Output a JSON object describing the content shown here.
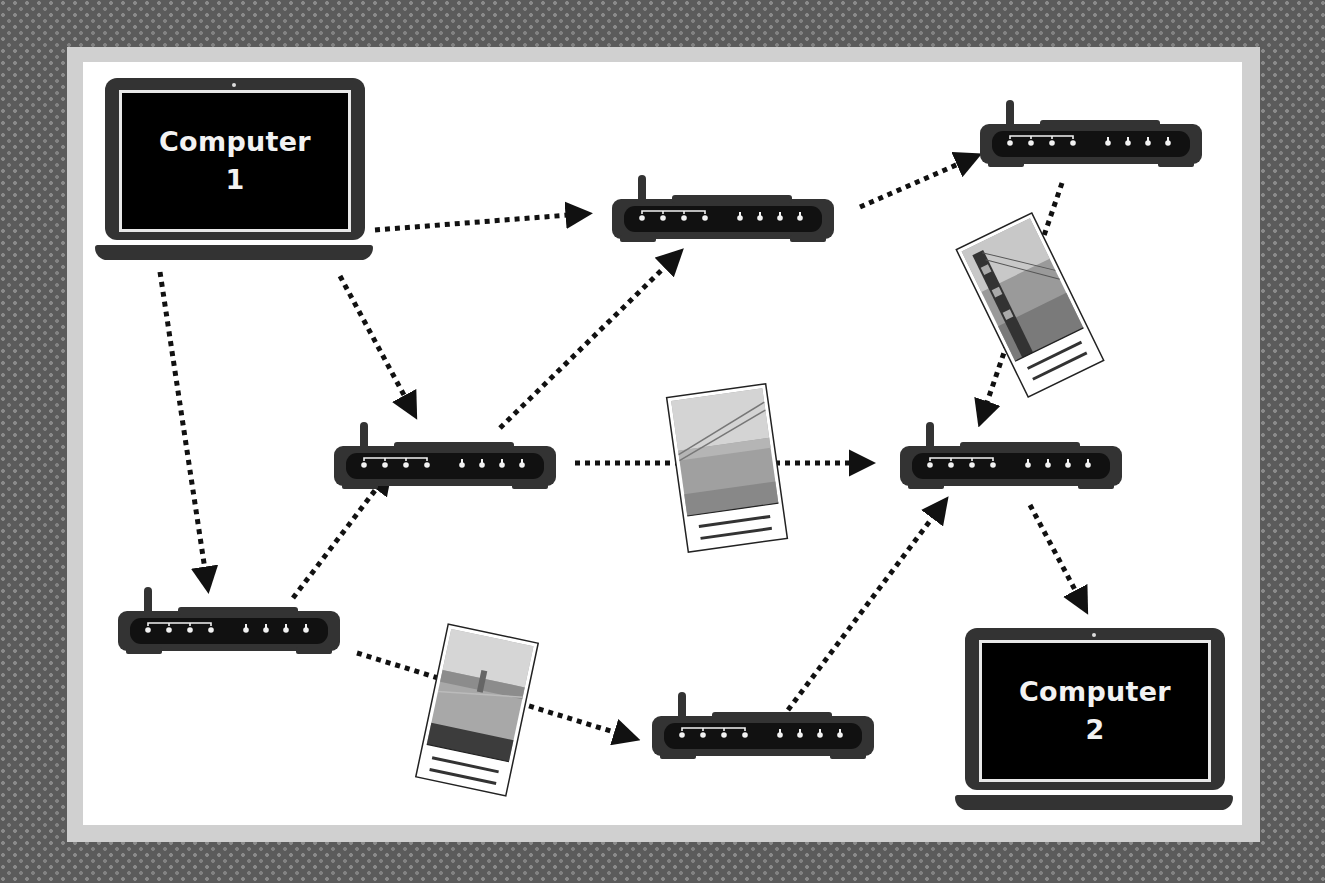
{
  "diagram": {
    "colors": {
      "background": "#5b5b5b",
      "frame": "#d0d0d0",
      "board": "#ffffff",
      "device": "#333333",
      "screen": "#000000",
      "arrow": "#111111"
    },
    "computers": [
      {
        "id": "computer-1",
        "line1": "Computer",
        "line2": "1"
      },
      {
        "id": "computer-2",
        "line1": "Computer",
        "line2": "2"
      }
    ],
    "routers": [
      {
        "id": "router-a",
        "label": "router",
        "x": 612,
        "y": 175
      },
      {
        "id": "router-b",
        "label": "router",
        "x": 980,
        "y": 100
      },
      {
        "id": "router-c",
        "label": "router",
        "x": 334,
        "y": 422
      },
      {
        "id": "router-d",
        "label": "router",
        "x": 900,
        "y": 422
      },
      {
        "id": "router-e",
        "label": "router",
        "x": 118,
        "y": 587
      },
      {
        "id": "router-f",
        "label": "router",
        "x": 652,
        "y": 692
      }
    ],
    "packets": [
      {
        "id": "packet-1",
        "content": "photo of Golden Gate Bridge tower",
        "rotation": -26
      },
      {
        "id": "packet-2",
        "content": "photo of Golden Gate Bridge cables and city",
        "rotation": -8
      },
      {
        "id": "packet-3",
        "content": "photo of Golden Gate Bridge from hillside",
        "rotation": 12
      }
    ],
    "connections": [
      {
        "from": "computer-1",
        "to": "router-a"
      },
      {
        "from": "computer-1",
        "to": "router-c"
      },
      {
        "from": "computer-1",
        "to": "router-e"
      },
      {
        "from": "router-a",
        "to": "router-b"
      },
      {
        "from": "router-b",
        "to": "router-d"
      },
      {
        "from": "router-c",
        "to": "router-a"
      },
      {
        "from": "router-c",
        "to": "router-d"
      },
      {
        "from": "router-e",
        "to": "router-c"
      },
      {
        "from": "router-e",
        "to": "router-f"
      },
      {
        "from": "router-f",
        "to": "router-d"
      },
      {
        "from": "router-d",
        "to": "computer-2"
      }
    ]
  }
}
